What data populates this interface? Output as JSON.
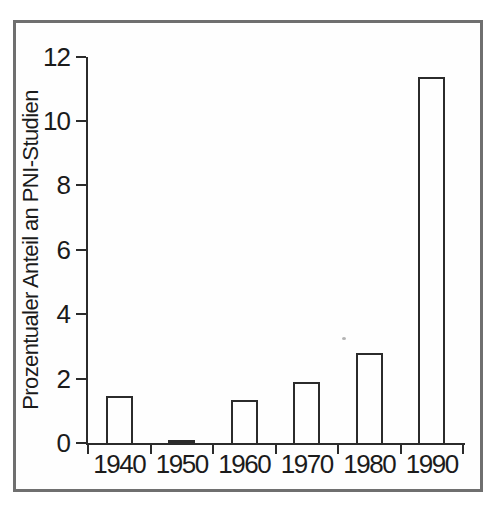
{
  "figure": {
    "background": "#ffffff",
    "frame_border_color": "#6f6f6f",
    "axis_color": "#2b2b2b",
    "text_color": "#1b1b1b",
    "bar_fill": "#fefefe",
    "bar_edge": "#2b2b2b"
  },
  "chart_data": {
    "type": "bar",
    "title": "",
    "categories": [
      "1940",
      "1950",
      "1960",
      "1970",
      "1980",
      "1990"
    ],
    "values": [
      1.45,
      0.05,
      1.35,
      1.9,
      2.8,
      11.35
    ],
    "xlabel": "",
    "ylabel": "Prozentualer Anteil an PNI-Studien",
    "ylim": [
      0,
      12
    ],
    "yticks": [
      0,
      2,
      4,
      6,
      8,
      10,
      12
    ],
    "grid": false,
    "legend": null,
    "bar_orientation": "vertical"
  }
}
